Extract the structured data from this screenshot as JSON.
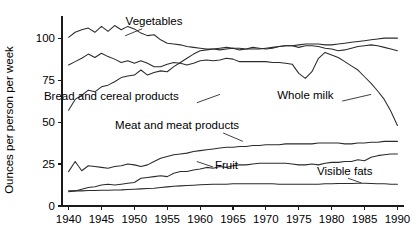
{
  "chart_data": {
    "type": "line",
    "title": "",
    "xlabel": "",
    "ylabel": "Ounces per person per week",
    "xlim": [
      1939,
      1991
    ],
    "ylim": [
      0,
      112
    ],
    "grid": false,
    "legend_position": "inline-annotations",
    "xticks": [
      1940,
      1945,
      1950,
      1955,
      1960,
      1965,
      1970,
      1975,
      1980,
      1985,
      1990
    ],
    "xtick_labels": [
      "1940",
      "1945",
      "1950",
      "1955",
      "1960",
      "1965",
      "1970",
      "1975",
      "1980",
      "1985",
      "1990"
    ],
    "yticks": [
      0,
      25,
      50,
      75,
      100
    ],
    "ytick_labels": [
      "0",
      "25",
      "50",
      "75",
      "100"
    ],
    "series": [
      {
        "name": "Vegetables",
        "label": "Vegetables",
        "label_x": 1953.0,
        "label_y": 108.0,
        "leader": [
          [
            1951.2,
            105.6
          ],
          [
            1948.6,
            101.4
          ]
        ],
        "x": [
          1940,
          1941,
          1942,
          1943,
          1944,
          1945,
          1946,
          1947,
          1948,
          1949,
          1950,
          1951,
          1952,
          1953,
          1954,
          1955,
          1956,
          1957,
          1958,
          1959,
          1960,
          1961,
          1962,
          1963,
          1964,
          1965,
          1966,
          1967,
          1968,
          1969,
          1970,
          1971,
          1972,
          1973,
          1974,
          1975,
          1976,
          1977,
          1978,
          1979,
          1980,
          1981,
          1982,
          1983,
          1984,
          1985,
          1986,
          1987,
          1988,
          1989,
          1990
        ],
        "values": [
          100.5,
          103.5,
          105.0,
          106.0,
          103.5,
          107.0,
          104.0,
          107.5,
          105.0,
          107.0,
          105.5,
          103.0,
          101.5,
          102.0,
          99.0,
          97.0,
          96.5,
          96.0,
          95.0,
          94.5,
          94.0,
          93.5,
          93.5,
          93.0,
          93.5,
          94.0,
          93.0,
          93.5,
          94.5,
          94.0,
          93.5,
          94.0,
          95.0,
          95.5,
          95.5,
          94.5,
          95.5,
          95.5,
          95.0,
          94.0,
          93.5,
          92.5,
          93.0,
          94.0,
          95.0,
          95.5,
          96.0,
          95.5,
          94.5,
          93.5,
          92.5
        ]
      },
      {
        "name": "Whole milk",
        "label": "Whole milk",
        "label_x": 1976.0,
        "label_y": 63.5,
        "leader": [
          [
            1981.6,
            62.5
          ],
          [
            1986.0,
            66.5
          ]
        ],
        "x": [
          1940,
          1941,
          1942,
          1943,
          1944,
          1945,
          1946,
          1947,
          1948,
          1949,
          1950,
          1951,
          1952,
          1953,
          1954,
          1955,
          1956,
          1957,
          1958,
          1959,
          1960,
          1961,
          1962,
          1963,
          1964,
          1965,
          1966,
          1967,
          1968,
          1969,
          1970,
          1971,
          1972,
          1973,
          1974,
          1975,
          1976,
          1977,
          1978,
          1979,
          1980,
          1981,
          1982,
          1983,
          1984,
          1985,
          1986,
          1987,
          1988,
          1989,
          1990
        ],
        "values": [
          84.0,
          86.0,
          88.0,
          90.5,
          88.5,
          91.0,
          89.0,
          87.5,
          85.5,
          86.5,
          85.0,
          86.5,
          85.0,
          83.0,
          83.0,
          84.5,
          85.5,
          85.0,
          84.0,
          85.0,
          86.5,
          87.0,
          86.5,
          87.0,
          88.0,
          87.5,
          86.0,
          86.0,
          86.0,
          86.0,
          86.0,
          85.5,
          85.5,
          85.0,
          84.5,
          79.0,
          76.0,
          80.0,
          88.0,
          91.5,
          90.0,
          88.5,
          86.0,
          83.5,
          81.0,
          77.0,
          73.0,
          68.5,
          63.5,
          56.5,
          48.0
        ]
      },
      {
        "name": "Bread and cereal products",
        "label": "Bread and cereal products",
        "label_x": 1946.5,
        "label_y": 63.0,
        "leader": [
          [
            1959.5,
            61.5
          ],
          [
            1963.0,
            66.5
          ]
        ],
        "x": [
          1940,
          1941,
          1942,
          1943,
          1944,
          1945,
          1946,
          1947,
          1948,
          1949,
          1950,
          1951,
          1952,
          1953,
          1954,
          1955,
          1956,
          1957,
          1958,
          1959,
          1960,
          1961,
          1962,
          1963,
          1964,
          1965,
          1966,
          1967,
          1968,
          1969,
          1970,
          1971,
          1972,
          1973,
          1974,
          1975,
          1976,
          1977,
          1978,
          1979,
          1980,
          1981,
          1982,
          1983,
          1984,
          1985,
          1986,
          1987,
          1988,
          1989,
          1990
        ],
        "values": [
          57.0,
          63.5,
          66.0,
          69.0,
          68.0,
          71.0,
          72.0,
          74.0,
          76.5,
          77.5,
          78.0,
          81.0,
          78.0,
          79.5,
          80.5,
          80.0,
          83.0,
          85.5,
          88.0,
          90.5,
          92.5,
          93.0,
          93.5,
          94.0,
          94.5,
          94.0,
          94.0,
          93.5,
          93.5,
          93.5,
          94.0,
          94.5,
          95.0,
          95.5,
          95.5,
          96.0,
          96.5,
          96.5,
          96.5,
          96.0,
          96.0,
          96.5,
          97.0,
          97.5,
          98.0,
          98.5,
          99.0,
          99.5,
          100.0,
          100.0,
          100.0
        ]
      },
      {
        "name": "Meat and meat products",
        "label": "Meat and meat products",
        "label_x": 1956.5,
        "label_y": 46.0,
        "leader": [
          [
            1963.5,
            43.5
          ],
          [
            1966.5,
            38.5
          ]
        ],
        "x": [
          1940,
          1941,
          1942,
          1943,
          1944,
          1945,
          1946,
          1947,
          1948,
          1949,
          1950,
          1951,
          1952,
          1953,
          1954,
          1955,
          1956,
          1957,
          1958,
          1959,
          1960,
          1961,
          1962,
          1963,
          1964,
          1965,
          1966,
          1967,
          1968,
          1969,
          1970,
          1971,
          1972,
          1973,
          1974,
          1975,
          1976,
          1977,
          1978,
          1979,
          1980,
          1981,
          1982,
          1983,
          1984,
          1985,
          1986,
          1987,
          1988,
          1989,
          1990
        ],
        "values": [
          20.5,
          26.5,
          21.0,
          24.0,
          23.5,
          23.0,
          22.5,
          23.5,
          24.0,
          25.0,
          24.5,
          23.5,
          24.5,
          26.5,
          28.5,
          29.5,
          30.5,
          31.0,
          31.5,
          32.5,
          33.0,
          33.5,
          34.0,
          34.5,
          35.0,
          35.0,
          35.5,
          35.5,
          36.0,
          36.0,
          36.5,
          36.5,
          36.5,
          37.0,
          37.0,
          37.0,
          37.0,
          37.0,
          37.5,
          37.5,
          37.5,
          37.5,
          37.0,
          37.0,
          37.5,
          37.5,
          38.0,
          38.0,
          38.5,
          38.5,
          38.5
        ]
      },
      {
        "name": "Fruit",
        "label": "Fruit",
        "label_x": 1964.0,
        "label_y": 22.0,
        "leader": [
          [
            1962.0,
            23.2
          ],
          [
            1959.5,
            26.5
          ]
        ],
        "x": [
          1940,
          1941,
          1942,
          1943,
          1944,
          1945,
          1946,
          1947,
          1948,
          1949,
          1950,
          1951,
          1952,
          1953,
          1954,
          1955,
          1956,
          1957,
          1958,
          1959,
          1960,
          1961,
          1962,
          1963,
          1964,
          1965,
          1966,
          1967,
          1968,
          1969,
          1970,
          1971,
          1972,
          1973,
          1974,
          1975,
          1976,
          1977,
          1978,
          1979,
          1980,
          1981,
          1982,
          1983,
          1984,
          1985,
          1986,
          1987,
          1988,
          1989,
          1990
        ],
        "values": [
          8.5,
          9.0,
          10.0,
          11.0,
          11.5,
          12.5,
          13.0,
          12.5,
          13.0,
          13.5,
          14.0,
          16.5,
          17.0,
          17.5,
          18.0,
          17.5,
          19.5,
          20.5,
          20.5,
          21.5,
          22.0,
          23.0,
          22.5,
          23.5,
          23.0,
          24.0,
          24.5,
          24.5,
          25.0,
          25.5,
          25.5,
          25.5,
          25.5,
          25.5,
          25.0,
          24.5,
          24.5,
          25.0,
          24.5,
          25.5,
          26.0,
          26.0,
          26.5,
          26.5,
          27.5,
          27.0,
          29.0,
          30.0,
          30.5,
          31.0,
          31.0
        ]
      },
      {
        "name": "Visible fats",
        "label": "Visible fats",
        "label_x": 1982.0,
        "label_y": 18.5,
        "leader": [
          [
            1982.5,
            16.5
          ],
          [
            1984.5,
            13.8
          ]
        ],
        "x": [
          1940,
          1941,
          1942,
          1943,
          1944,
          1945,
          1946,
          1947,
          1948,
          1949,
          1950,
          1951,
          1952,
          1953,
          1954,
          1955,
          1956,
          1957,
          1958,
          1959,
          1960,
          1961,
          1962,
          1963,
          1964,
          1965,
          1966,
          1967,
          1968,
          1969,
          1970,
          1971,
          1972,
          1973,
          1974,
          1975,
          1976,
          1977,
          1978,
          1979,
          1980,
          1981,
          1982,
          1983,
          1984,
          1985,
          1986,
          1987,
          1988,
          1989,
          1990
        ],
        "values": [
          9.0,
          9.0,
          9.0,
          9.2,
          9.2,
          9.4,
          9.4,
          9.5,
          9.6,
          9.8,
          10.0,
          10.2,
          10.4,
          10.6,
          11.0,
          11.4,
          11.8,
          12.0,
          12.2,
          12.4,
          12.6,
          12.8,
          13.0,
          13.0,
          13.0,
          13.2,
          13.2,
          13.2,
          13.2,
          13.2,
          13.2,
          13.2,
          13.0,
          13.0,
          13.0,
          13.0,
          13.0,
          13.0,
          13.0,
          13.2,
          13.2,
          13.4,
          13.4,
          13.4,
          13.6,
          13.6,
          13.4,
          13.2,
          13.2,
          13.0,
          13.0
        ]
      }
    ]
  },
  "axes": {
    "y_axis_title": "Ounces per person per week"
  }
}
